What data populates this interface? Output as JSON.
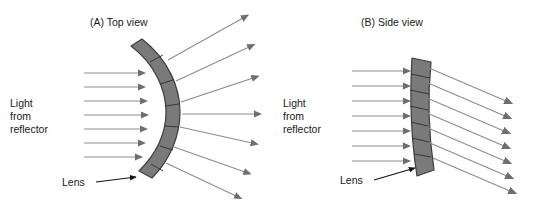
{
  "figure": {
    "background_color": "#ffffff",
    "width": 547,
    "height": 206,
    "ray_color": "#8c8c8c",
    "arrowhead_color": "#6e6e6e",
    "lens_fill_color": "#7a7a7a",
    "lens_stroke_color": "#3d3d3d",
    "text_color": "#1a1a1a",
    "leader_color": "#111111"
  },
  "panels": [
    {
      "id": "panel-a",
      "title": "(A) Top view",
      "source_label_lines": [
        "Light",
        "from",
        "reflector"
      ],
      "lens_label": "Lens",
      "incoming_ray_count": 7,
      "outgoing_ray_count": 7,
      "lens_segment_count": 6,
      "lens_shape": "strongly-curved-arc",
      "beam_behavior": "diverging-fan"
    },
    {
      "id": "panel-b",
      "title": "(B) Side view",
      "source_label_lines": [
        "Light",
        "from",
        "reflector"
      ],
      "lens_label": "Lens",
      "incoming_ray_count": 7,
      "outgoing_ray_count": 7,
      "lens_segment_count": 7,
      "lens_shape": "shallow-vertical-band",
      "beam_behavior": "parallel-downward-tilt"
    }
  ]
}
